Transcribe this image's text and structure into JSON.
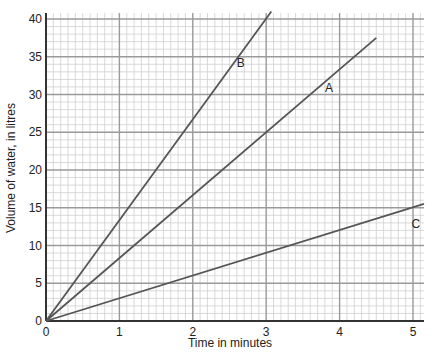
{
  "chart_data": {
    "type": "line",
    "title": "",
    "xlabel": "Time in minutes",
    "ylabel": "Volume of water, in litres",
    "xlim": [
      0,
      5.15
    ],
    "ylim": [
      0,
      40.8
    ],
    "x_ticks": [
      0,
      1,
      2,
      3,
      4,
      5
    ],
    "y_ticks": [
      0,
      5,
      10,
      15,
      20,
      25,
      30,
      35,
      40
    ],
    "grid": {
      "on": true,
      "x_minor_step": 0.1,
      "y_minor_step": 1,
      "x_major_step": 1,
      "y_major_step": 5
    },
    "legend": "inline labels",
    "series": [
      {
        "name": "A",
        "x": [
          0,
          4.5
        ],
        "y": [
          0,
          37.5
        ],
        "rate_litres_per_minute": 8.33,
        "label_position": {
          "x": 3.8,
          "y": 30.3
        }
      },
      {
        "name": "B",
        "x": [
          0,
          3.07
        ],
        "y": [
          0,
          41
        ],
        "rate_litres_per_minute": 13.33,
        "label_position": {
          "x": 2.6,
          "y": 33.7
        }
      },
      {
        "name": "C",
        "x": [
          0,
          5.15
        ],
        "y": [
          0,
          15.5
        ],
        "rate_litres_per_minute": 3,
        "label_position": {
          "x": 4.98,
          "y": 12.3
        }
      }
    ]
  },
  "colors": {
    "line": "#555555",
    "axis": "#333333",
    "grid_minor": "#cfcfcf",
    "grid_major": "#9a9a9a"
  }
}
